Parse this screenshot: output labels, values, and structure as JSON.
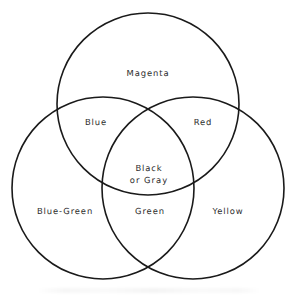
{
  "diagram": {
    "type": "venn-3-set",
    "background_color": "#ffffff",
    "stroke_color": "#1a1a1a",
    "stroke_width": 1.6,
    "text_color": "#2b2b2b",
    "canvas": {
      "width": 295,
      "height": 297
    },
    "circles": [
      {
        "id": "top",
        "name": "top-circle",
        "cx": 148,
        "cy": 104,
        "r": 91
      },
      {
        "id": "bottom-left",
        "name": "bottom-left-circle",
        "cx": 103,
        "cy": 188,
        "r": 91
      },
      {
        "id": "bottom-right",
        "name": "bottom-right-circle",
        "cx": 193,
        "cy": 188,
        "r": 91
      }
    ],
    "regions": [
      {
        "id": "magenta",
        "label": "Magenta",
        "sets": [
          "top"
        ],
        "x": 148,
        "y": 73
      },
      {
        "id": "blue",
        "label": "Blue",
        "sets": [
          "top",
          "bottom-left"
        ],
        "x": 96,
        "y": 122
      },
      {
        "id": "red",
        "label": "Red",
        "sets": [
          "top",
          "bottom-right"
        ],
        "x": 203,
        "y": 122
      },
      {
        "id": "black-or-gray",
        "label_line_1": "Black",
        "label_line_2": "or  Gray",
        "sets": [
          "top",
          "bottom-left",
          "bottom-right"
        ],
        "x": 149,
        "y": 174
      },
      {
        "id": "blue-green",
        "label": "Blue-Green",
        "sets": [
          "bottom-left"
        ],
        "x": 65,
        "y": 211
      },
      {
        "id": "green",
        "label": "Green",
        "sets": [
          "bottom-left",
          "bottom-right"
        ],
        "x": 150,
        "y": 211
      },
      {
        "id": "yellow",
        "label": "Yellow",
        "sets": [
          "bottom-right"
        ],
        "x": 228,
        "y": 211
      }
    ]
  }
}
